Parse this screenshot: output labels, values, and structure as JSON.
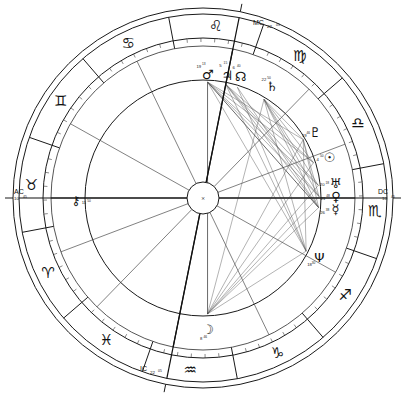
{
  "chart": {
    "type": "astrological-wheel",
    "center_mark": "×",
    "geometry": {
      "cx": 203,
      "cy": 198,
      "r_outer": 190,
      "r_outer2": 184,
      "r_sign_band_inner": 160,
      "r_degree_ring": 152,
      "r_house_ring": 118,
      "r_hub": 16,
      "ascendant_longitude_deg": 40.75
    },
    "angles": [
      {
        "id": "AC",
        "label": "AC",
        "deg": "10",
        "min": "45",
        "longitude": 40.75,
        "side": "left"
      },
      {
        "id": "DC",
        "label": "DC",
        "deg": "10",
        "min": "45",
        "longitude": 220.75,
        "side": "right"
      },
      {
        "id": "MC",
        "label": "MC",
        "deg": "22",
        "min": "05",
        "longitude": 322.08,
        "side": "top"
      },
      {
        "id": "IC",
        "label": "IC",
        "deg": "22",
        "min": "05",
        "longitude": 142.08,
        "side": "bottom"
      }
    ],
    "signs": [
      {
        "name": "Aries",
        "glyph": "♈",
        "start_longitude": 0
      },
      {
        "name": "Taurus",
        "glyph": "♉",
        "start_longitude": 30
      },
      {
        "name": "Gemini",
        "glyph": "♊",
        "start_longitude": 60
      },
      {
        "name": "Cancer",
        "glyph": "♋",
        "start_longitude": 90
      },
      {
        "name": "Leo",
        "glyph": "♌",
        "start_longitude": 120
      },
      {
        "name": "Virgo",
        "glyph": "♍",
        "start_longitude": 150
      },
      {
        "name": "Libra",
        "glyph": "♎",
        "start_longitude": 180
      },
      {
        "name": "Scorpio",
        "glyph": "♏",
        "start_longitude": 210
      },
      {
        "name": "Sagittarius",
        "glyph": "♐",
        "start_longitude": 240
      },
      {
        "name": "Capricorn",
        "glyph": "♑",
        "start_longitude": 270
      },
      {
        "name": "Aquarius",
        "glyph": "♒",
        "start_longitude": 300
      },
      {
        "name": "Pisces",
        "glyph": "♓",
        "start_longitude": 330
      }
    ],
    "planets": [
      {
        "name": "Moon",
        "glyph": "☽",
        "deg": "8",
        "min": "46",
        "longitude": 308.5,
        "radius": 132,
        "deg_dx": -7,
        "deg_dy": 9,
        "min_dx": -3,
        "min_dy": 7
      },
      {
        "name": "Neptune",
        "glyph": "Ψ",
        "deg": "18",
        "min": "30",
        "longitude": 248.0,
        "radius": 131,
        "deg_dx": -10,
        "deg_dy": 7,
        "min_dx": -6,
        "min_dy": 5
      },
      {
        "name": "Mercury",
        "glyph": "☿",
        "deg": "26",
        "min": "38",
        "longitude": 225.5,
        "radius": 133,
        "deg_dx": -13,
        "deg_dy": 3,
        "min_dx": -8,
        "min_dy": 1
      },
      {
        "name": "Venus",
        "glyph": "♀",
        "deg": "21",
        "min": "48",
        "longitude": 220.0,
        "radius": 133,
        "deg_dx": -13,
        "deg_dy": 2,
        "min_dx": -8,
        "min_dy": 0
      },
      {
        "name": "Uranus",
        "glyph": "♅",
        "deg": "20",
        "min": "18",
        "longitude": 214.5,
        "radius": 133,
        "deg_dx": -13,
        "deg_dy": 1,
        "min_dx": -8,
        "min_dy": -1
      },
      {
        "name": "Sun",
        "glyph": "☉",
        "deg": "4",
        "min": "50",
        "longitude": 203.0,
        "radius": 133,
        "deg_dx": -12,
        "deg_dy": 2,
        "min_dx": -8,
        "min_dy": -1
      },
      {
        "name": "Pluto",
        "glyph": "♇",
        "deg": "19",
        "min": "46",
        "longitude": 190.5,
        "radius": 130,
        "deg_dx": -11,
        "deg_dy": 3,
        "min_dx": -7,
        "min_dy": 0
      },
      {
        "name": "Saturn",
        "glyph": "♄",
        "deg": "22",
        "min": "50",
        "longitude": 162.5,
        "radius": 131,
        "deg_dx": -8,
        "deg_dy": -7,
        "min_dx": -3,
        "min_dy": -9
      },
      {
        "name": "NorthNode",
        "glyph": "☊",
        "deg": "6",
        "min": "40",
        "longitude": 148.0,
        "radius": 127,
        "deg_dx": -7,
        "deg_dy": -9,
        "min_dx": -2,
        "min_dy": -11
      },
      {
        "name": "Jupiter",
        "glyph": "♃",
        "deg": "5",
        "min": "15",
        "longitude": 142.0,
        "radius": 125,
        "deg_dx": -7,
        "deg_dy": -10,
        "min_dx": -2,
        "min_dy": -12
      },
      {
        "name": "Mars",
        "glyph": "♂",
        "deg": "19",
        "min": "13",
        "longitude": 133.0,
        "radius": 124,
        "deg_dx": -9,
        "deg_dy": -8,
        "min_dx": -4,
        "min_dy": -10
      },
      {
        "name": "Chiron",
        "glyph": "⚷",
        "deg": "11",
        "min": "50",
        "longitude": 39.5,
        "radius": 127,
        "deg_dx": 8,
        "deg_dy": 2,
        "min_dx": 13,
        "min_dy": 0
      }
    ],
    "aspects": [
      {
        "from": "Moon",
        "to": "Mercury",
        "weight": "thin"
      },
      {
        "from": "Moon",
        "to": "Venus",
        "weight": "thin"
      },
      {
        "from": "Moon",
        "to": "Uranus",
        "weight": "thin"
      },
      {
        "from": "Moon",
        "to": "Sun",
        "weight": "thin"
      },
      {
        "from": "Moon",
        "to": "Neptune",
        "weight": "thin"
      },
      {
        "from": "Moon",
        "to": "Pluto",
        "weight": "thin"
      },
      {
        "from": "Moon",
        "to": "Saturn",
        "weight": "thin"
      },
      {
        "from": "Moon",
        "to": "Mars",
        "weight": "dark"
      },
      {
        "from": "Mars",
        "to": "Mercury",
        "weight": "dark"
      },
      {
        "from": "Mars",
        "to": "Venus",
        "weight": "thin"
      },
      {
        "from": "Mars",
        "to": "Uranus",
        "weight": "thin"
      },
      {
        "from": "Mars",
        "to": "Sun",
        "weight": "thin"
      },
      {
        "from": "Mars",
        "to": "Neptune",
        "weight": "thin"
      },
      {
        "from": "Mars",
        "to": "Pluto",
        "weight": "thin"
      },
      {
        "from": "Jupiter",
        "to": "Mercury",
        "weight": "thin"
      },
      {
        "from": "Jupiter",
        "to": "Venus",
        "weight": "thin"
      },
      {
        "from": "Jupiter",
        "to": "Uranus",
        "weight": "thin"
      },
      {
        "from": "Jupiter",
        "to": "Neptune",
        "weight": "thin"
      },
      {
        "from": "Jupiter",
        "to": "Sun",
        "weight": "thin"
      },
      {
        "from": "Saturn",
        "to": "Mercury",
        "weight": "thin"
      },
      {
        "from": "Saturn",
        "to": "Venus",
        "weight": "thin"
      },
      {
        "from": "Saturn",
        "to": "Uranus",
        "weight": "thin"
      },
      {
        "from": "Saturn",
        "to": "Neptune",
        "weight": "thin"
      },
      {
        "from": "Saturn",
        "to": "Sun",
        "weight": "thin"
      },
      {
        "from": "Saturn",
        "to": "Pluto",
        "weight": "thin"
      },
      {
        "from": "Pluto",
        "to": "Neptune",
        "weight": "thin"
      },
      {
        "from": "Pluto",
        "to": "Mercury",
        "weight": "thin"
      },
      {
        "from": "Pluto",
        "to": "Venus",
        "weight": "thin"
      },
      {
        "from": "NorthNode",
        "to": "Neptune",
        "weight": "thin"
      },
      {
        "from": "NorthNode",
        "to": "Mercury",
        "weight": "thin"
      }
    ],
    "house_cusps": [
      40.75,
      70.0,
      105.0,
      142.08,
      175.0,
      200.0,
      220.75,
      250.0,
      285.0,
      322.08,
      355.0,
      20.0
    ]
  }
}
